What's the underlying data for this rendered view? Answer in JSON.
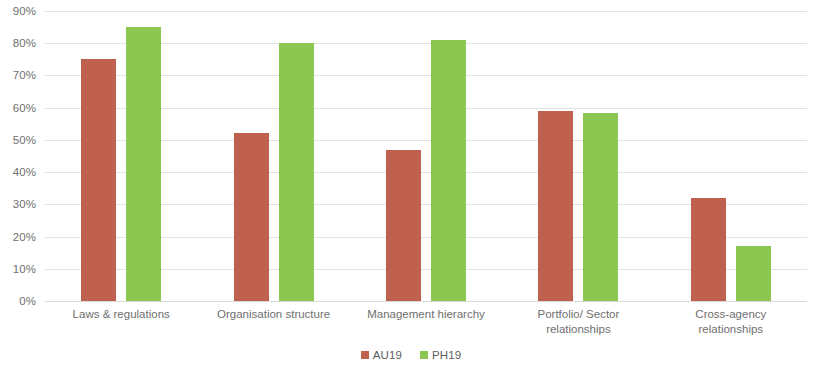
{
  "chart_data": {
    "type": "bar",
    "title": "",
    "subtitle": "",
    "xlabel": "",
    "ylabel": "",
    "ylim": [
      0,
      90
    ],
    "y_tick_step": 10,
    "y_tick_labels": [
      "90%",
      "80%",
      "70%",
      "60%",
      "50%",
      "40%",
      "30%",
      "20%",
      "10%",
      "0%"
    ],
    "y_tick_values": [
      90,
      80,
      70,
      60,
      50,
      40,
      30,
      20,
      10,
      0
    ],
    "grid": true,
    "grid_axis": "y",
    "legend_position": "bottom",
    "value_format": "percent",
    "categories": [
      "Laws & regulations",
      "Organisation structure",
      "Management hierarchy",
      "Portfolio/ Sector\nrelationships",
      "Cross-agency\nrelationships"
    ],
    "series": [
      {
        "name": "AU19",
        "color": "#c0604e",
        "values": [
          75,
          52,
          47,
          59,
          32
        ]
      },
      {
        "name": "PH19",
        "color": "#8cc751",
        "values": [
          85,
          80,
          81,
          58.5,
          17
        ]
      }
    ]
  },
  "legend": {
    "items": [
      {
        "label": "AU19",
        "color": "#c0604e"
      },
      {
        "label": "PH19",
        "color": "#8cc751"
      }
    ]
  },
  "colors": {
    "series_au19": "#c0604e",
    "series_ph19": "#8cc751",
    "gridline": "#e2e2e2",
    "tick_text": "#6f6f6f",
    "background": "#ffffff"
  }
}
